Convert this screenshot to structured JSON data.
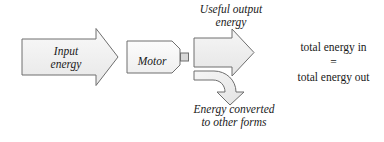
{
  "diagram": {
    "background_color": "#ffffff",
    "stroke_color": "#6e6e6e",
    "text_color": "#1a1a1a",
    "shapes": {
      "input_arrow": {
        "name": "input-energy-arrow",
        "label_line1": "Input",
        "label_line2": "energy",
        "fill_top": "#f7f7f7",
        "fill_bottom": "#e9e9e9",
        "direction": "right"
      },
      "motor_box": {
        "name": "motor-box",
        "label": "Motor",
        "fill_top": "#fbfbfb",
        "fill_bottom": "#f0f0f0",
        "shape": "rectangle-with-clipped-right-corners",
        "has_shaft_stub": true
      },
      "output_arrow": {
        "name": "useful-output-arrow",
        "label_line1": "Useful output",
        "label_line2": "energy",
        "fill_top": "#f5f5f5",
        "fill_bottom": "#e6e6e6",
        "direction": "right"
      },
      "waste_arrow": {
        "name": "waste-energy-curved-arrow",
        "label_line1": "Energy converted",
        "label_line2": "to other forms",
        "fill_top": "#f5f5f5",
        "fill_bottom": "#e4e4e4",
        "direction": "curve-down-right"
      }
    },
    "conservation_statement": {
      "line1": "total energy in",
      "equals": "=",
      "line2": "total energy out"
    }
  }
}
